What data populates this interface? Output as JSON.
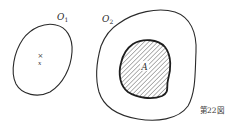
{
  "figure": {
    "caption": "第22図",
    "sets": [
      {
        "id": "O1",
        "label": "O",
        "subscript": "1",
        "description": "open set containing point x"
      },
      {
        "id": "O2",
        "label": "O",
        "subscript": "2",
        "description": "open set containing hatched set A"
      },
      {
        "id": "A",
        "label": "A",
        "description": "hatched closed set inside O2"
      }
    ],
    "point": {
      "marker": "×",
      "label": "x"
    },
    "colors": {
      "stroke": "#2a2a2a",
      "hatch": "#555555",
      "background": "#ffffff"
    }
  }
}
